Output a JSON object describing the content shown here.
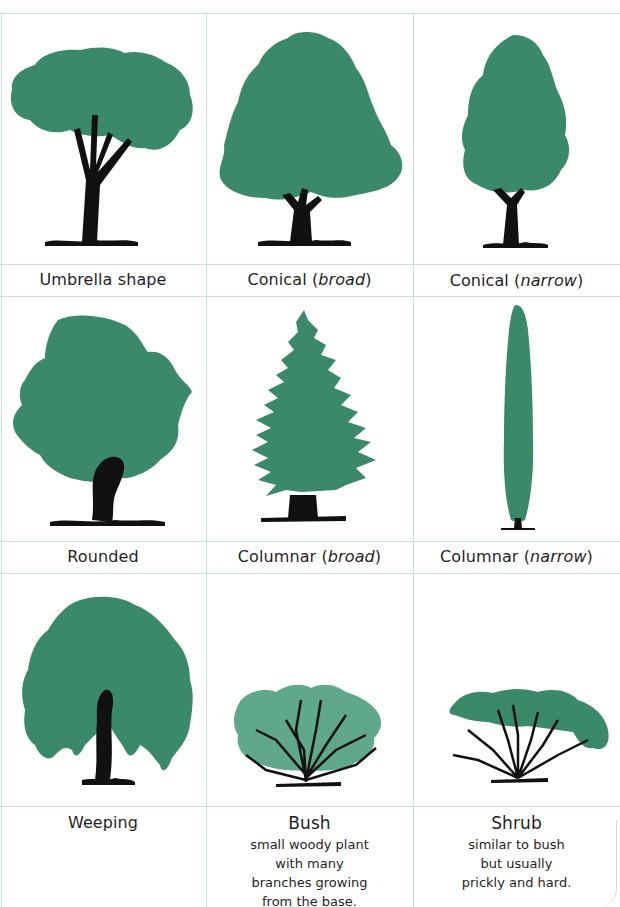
{
  "figure": {
    "colors": {
      "foliage": "#3a8a6a",
      "trunk": "#111111",
      "grid": "#c9dfdb",
      "bush_foliage": "#5fa88a"
    },
    "cells": [
      {
        "name": "Umbrella shape",
        "label_main": "Umbrella shape",
        "label_qualifier": ""
      },
      {
        "name": "Conical (broad)",
        "label_main": "Conical (",
        "label_qualifier": "broad",
        "label_end": ")"
      },
      {
        "name": "Conical (narrow)",
        "label_main": "Conical (",
        "label_qualifier": "narrow",
        "label_end": ")"
      },
      {
        "name": "Rounded",
        "label_main": "Rounded",
        "label_qualifier": ""
      },
      {
        "name": "Columnar (broad)",
        "label_main": "Columnar (",
        "label_qualifier": "broad",
        "label_end": ")"
      },
      {
        "name": "Columnar (narrow)",
        "label_main": "Columnar (",
        "label_qualifier": "narrow",
        "label_end": ")"
      },
      {
        "name": "Weeping",
        "label_main": "Weeping",
        "label_qualifier": ""
      },
      {
        "name": "Bush",
        "label_main": "Bush",
        "label_qualifier": "",
        "description": [
          "small woody plant",
          "with many",
          "branches growing",
          "from the base."
        ]
      },
      {
        "name": "Shrub",
        "label_main": "Shrub",
        "label_qualifier": "",
        "description": [
          "similar to bush",
          "but usually",
          "prickly and hard."
        ]
      }
    ]
  }
}
